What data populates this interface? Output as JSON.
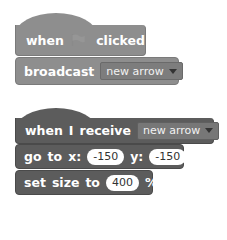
{
  "colors": {
    "script1_block": "#8e8e8e",
    "script2_block": "#5c5c5c",
    "background": "#ffffff"
  },
  "script1": {
    "hat": {
      "word1": "when",
      "icon": "green-flag-icon",
      "word2": "clicked"
    },
    "broadcast": {
      "label": "broadcast",
      "message": "new arrow"
    }
  },
  "script2": {
    "hat": {
      "word1": "when",
      "word2": "I",
      "word3": "receive",
      "message": "new arrow"
    },
    "goto": {
      "label1": "go",
      "label2": "to",
      "label3": "x:",
      "x_value": "-150",
      "label4": "y:",
      "y_value": "-150"
    },
    "setsize": {
      "label1": "set",
      "label2": "size",
      "label3": "to",
      "value": "400",
      "unit": "%"
    }
  }
}
